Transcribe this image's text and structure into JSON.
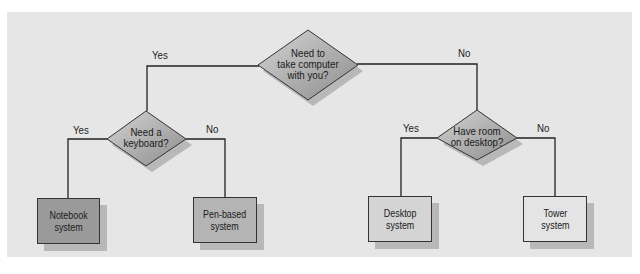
{
  "diagram": {
    "type": "decision-tree",
    "colors": {
      "panel": "#e6e6e6",
      "diamond_fill": "#a8a8a8",
      "diamond_highlight": "#d4d4d4",
      "dark_box_fill": "#9a9a9a",
      "light_box_fill": "#d9d9d9",
      "shadow": "#b8b8b8",
      "line": "#222222"
    },
    "root": {
      "question": [
        "Need to",
        "take computer",
        "with you?"
      ],
      "yes_label": "Yes",
      "no_label": "No"
    },
    "left_decision": {
      "question": [
        "Need a",
        "keyboard?"
      ],
      "yes_label": "Yes",
      "no_label": "No"
    },
    "right_decision": {
      "question": [
        "Have room",
        "on desktop?"
      ],
      "yes_label": "Yes",
      "no_label": "No"
    },
    "outcomes": [
      {
        "lines": [
          "Notebook",
          "system"
        ]
      },
      {
        "lines": [
          "Pen-based",
          "system"
        ]
      },
      {
        "lines": [
          "Desktop",
          "system"
        ]
      },
      {
        "lines": [
          "Tower",
          "system"
        ]
      }
    ]
  }
}
